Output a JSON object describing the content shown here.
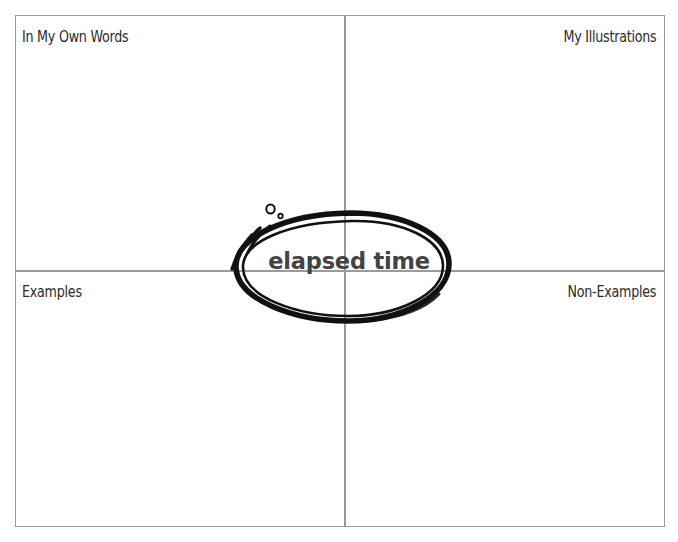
{
  "organizer": {
    "type": "frayer-model",
    "term": "elapsed time",
    "quadrants": {
      "top_left": "In My Own Words",
      "top_right": "My Illustrations",
      "bottom_left": "Examples",
      "bottom_right": "Non-Examples"
    },
    "colors": {
      "background": "#ffffff",
      "grid_line": "#9a9a9a",
      "label_text": "#2b2b2b",
      "term_text": "#434343",
      "oval_stroke": "#111111"
    },
    "decorations": {
      "speed_lines": "three-curved-motion-lines",
      "bubbles": "two-small-circles"
    }
  }
}
